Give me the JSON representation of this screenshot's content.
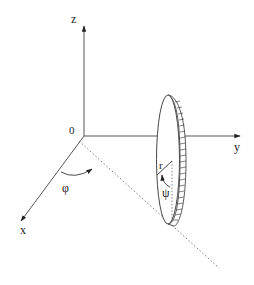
{
  "diagram": {
    "type": "3d-coordinate-diagram",
    "axes": {
      "z": {
        "label": "z"
      },
      "y": {
        "label": "y"
      },
      "x": {
        "label": "x"
      },
      "origin": {
        "label": "0"
      }
    },
    "annotations": {
      "phi": {
        "label": "φ"
      },
      "psi": {
        "label": "ψ"
      },
      "radius": {
        "label": "r"
      }
    },
    "colors": {
      "line": "#333333",
      "background": "#ffffff"
    }
  }
}
